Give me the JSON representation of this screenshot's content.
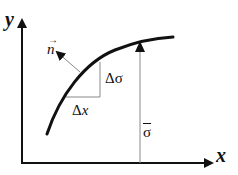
{
  "diagram": {
    "axes": {
      "x_label": "x",
      "y_label": "y"
    },
    "labels": {
      "normal_vector": "n",
      "delta_sigma": "Δσ",
      "delta_x_prefix": "Δ",
      "delta_x_var": "x",
      "sigma_bar": "σ"
    },
    "colors": {
      "axis": "#111111",
      "curve": "#111111",
      "helper_lines": "#888888"
    }
  }
}
